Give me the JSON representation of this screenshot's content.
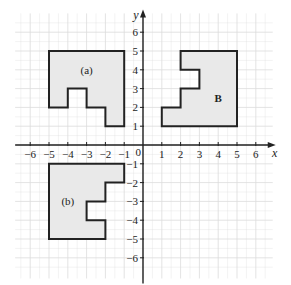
{
  "diagram": {
    "type": "coordinate-grid",
    "origin_px": [
      143,
      145
    ],
    "unit_px": 18.8,
    "x_range": [
      -6.8,
      6.9
    ],
    "y_range": [
      -7.0,
      7.0
    ],
    "axes": {
      "x_label": "x",
      "y_label": "y",
      "origin_label": "0",
      "x_ticks": [
        {
          "value": -6,
          "label": "−6"
        },
        {
          "value": -5,
          "label": "−5"
        },
        {
          "value": -4,
          "label": "−4"
        },
        {
          "value": -3,
          "label": "−3"
        },
        {
          "value": -2,
          "label": "−2"
        },
        {
          "value": -1,
          "label": "−1"
        },
        {
          "value": 1,
          "label": "1"
        },
        {
          "value": 2,
          "label": "2"
        },
        {
          "value": 3,
          "label": "3"
        },
        {
          "value": 4,
          "label": "4"
        },
        {
          "value": 5,
          "label": "5"
        },
        {
          "value": 6,
          "label": "6"
        }
      ],
      "y_ticks": [
        {
          "value": 6,
          "label": "6"
        },
        {
          "value": 5,
          "label": "5"
        },
        {
          "value": 4,
          "label": "4"
        },
        {
          "value": 3,
          "label": "3"
        },
        {
          "value": 2,
          "label": "2"
        },
        {
          "value": 1,
          "label": "1"
        },
        {
          "value": -1,
          "label": "−1"
        },
        {
          "value": -2,
          "label": "−2"
        },
        {
          "value": -3,
          "label": "−3"
        },
        {
          "value": -4,
          "label": "−4"
        },
        {
          "value": -5,
          "label": "−5"
        },
        {
          "value": -6,
          "label": "−6"
        }
      ]
    },
    "shapes": [
      {
        "id": "shape-a",
        "label": "(a)",
        "label_pos": [
          -3,
          4
        ],
        "bold": false,
        "vertices": [
          [
            -5,
            5
          ],
          [
            -1,
            5
          ],
          [
            -1,
            1
          ],
          [
            -2,
            1
          ],
          [
            -2,
            2
          ],
          [
            -3,
            2
          ],
          [
            -3,
            3
          ],
          [
            -4,
            3
          ],
          [
            -4,
            2
          ],
          [
            -5,
            2
          ]
        ]
      },
      {
        "id": "shape-b-upper",
        "label": "B",
        "label_pos": [
          4,
          2.5
        ],
        "bold": true,
        "vertices": [
          [
            2,
            5
          ],
          [
            5,
            5
          ],
          [
            5,
            1
          ],
          [
            1,
            1
          ],
          [
            1,
            2
          ],
          [
            2,
            2
          ],
          [
            2,
            3
          ],
          [
            3,
            3
          ],
          [
            3,
            4
          ],
          [
            2,
            4
          ]
        ]
      },
      {
        "id": "shape-b-lower",
        "label": "(b)",
        "label_pos": [
          -4,
          -3
        ],
        "bold": false,
        "vertices": [
          [
            -5,
            -1
          ],
          [
            -1,
            -1
          ],
          [
            -1,
            -2
          ],
          [
            -2,
            -2
          ],
          [
            -2,
            -3
          ],
          [
            -3,
            -3
          ],
          [
            -3,
            -4
          ],
          [
            -2,
            -4
          ],
          [
            -2,
            -5
          ],
          [
            -5,
            -5
          ]
        ]
      }
    ],
    "colors": {
      "grid": "#dcdcdc",
      "axis": "#222222",
      "fill": "#e9e9e9",
      "outline": "#222222"
    }
  }
}
